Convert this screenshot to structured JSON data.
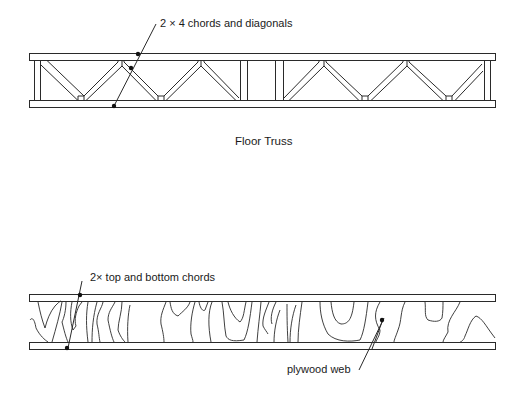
{
  "figures": [
    {
      "name": "floor-truss",
      "caption": "Floor Truss",
      "callout": "2 × 4 chords and diagonals"
    },
    {
      "name": "plywood-web-truss",
      "callout_chords": "2× top and bottom chords",
      "callout_web": "plywood web"
    }
  ],
  "colors": {
    "line": "#2a2a2a",
    "background": "#ffffff"
  }
}
